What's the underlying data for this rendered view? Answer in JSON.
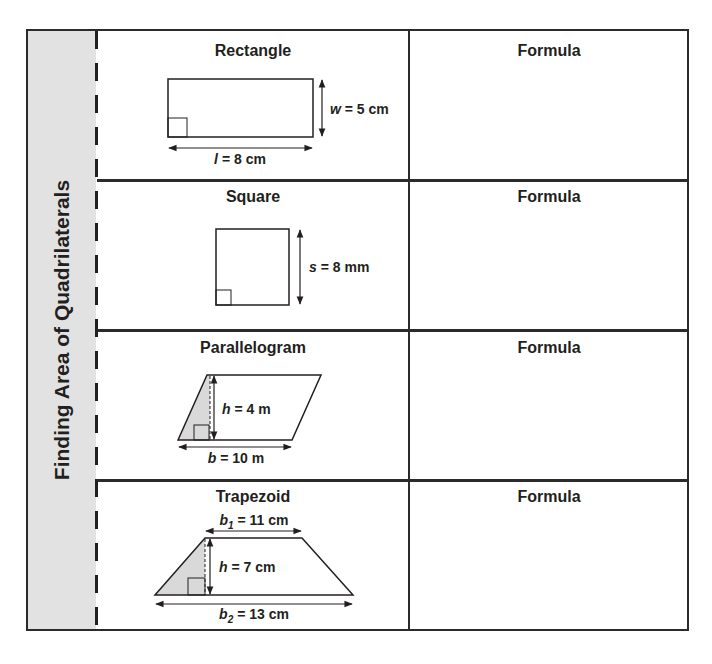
{
  "side_title": "Finding Area of Quadrilaterals",
  "rows": [
    {
      "shape": "Rectangle",
      "formula_label": "Formula",
      "dimensions": {
        "width_var": "w",
        "width_value": "= 5 cm",
        "length_var": "l",
        "length_value": "= 8 cm"
      }
    },
    {
      "shape": "Square",
      "formula_label": "Formula",
      "dimensions": {
        "side_var": "s",
        "side_value": "= 8 mm"
      }
    },
    {
      "shape": "Parallelogram",
      "formula_label": "Formula",
      "dimensions": {
        "height_var": "h",
        "height_value": "= 4 m",
        "base_var": "b",
        "base_value": "= 10 m"
      }
    },
    {
      "shape": "Trapezoid",
      "formula_label": "Formula",
      "dimensions": {
        "base1_var": "b",
        "base1_sub": "1",
        "base1_value": "= 11 cm",
        "height_var": "h",
        "height_value": "= 7 cm",
        "base2_var": "b",
        "base2_sub": "2",
        "base2_value": "= 13 cm"
      }
    }
  ],
  "colors": {
    "line": "#231f20",
    "shade": "#d9d9d9",
    "side_band": "#e2e2e2"
  }
}
